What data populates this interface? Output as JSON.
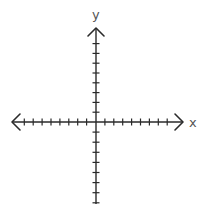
{
  "diagram": {
    "type": "coordinate-plane",
    "x_axis": {
      "label": "x",
      "ticks_negative": 8,
      "ticks_positive": 8,
      "arrows": [
        "left",
        "right"
      ]
    },
    "y_axis": {
      "label": "y",
      "ticks_positive": 8,
      "ticks_negative": 8,
      "arrows": [
        "up"
      ]
    },
    "colors": {
      "axis": "#2a2a2a",
      "label": "#555555",
      "background": "#ffffff"
    }
  }
}
